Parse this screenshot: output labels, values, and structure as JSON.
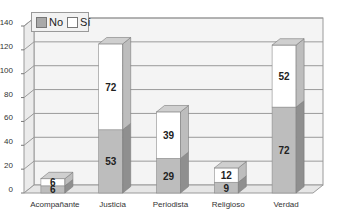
{
  "chart_data": {
    "type": "bar",
    "stacked": true,
    "style": "3d",
    "title": "",
    "xlabel": "",
    "ylabel": "",
    "categories": [
      "Acompañante",
      "Justicia",
      "Periodista",
      "Religioso",
      "Verdad"
    ],
    "series": [
      {
        "name": "No",
        "values": [
          6,
          53,
          29,
          9,
          72
        ],
        "color": "#bdbdbd"
      },
      {
        "name": "Sí",
        "values": [
          6,
          72,
          39,
          12,
          52
        ],
        "color": "#ffffff"
      }
    ],
    "ylim": [
      0,
      140
    ],
    "yticks": [
      0,
      20,
      40,
      60,
      80,
      100,
      120,
      140
    ],
    "grid": true,
    "legend_position": "top-left-inside"
  },
  "legend": {
    "items": [
      {
        "label": "No",
        "color": "#a9a9a9"
      },
      {
        "label": "Sí",
        "color": "#ffffff"
      }
    ]
  }
}
